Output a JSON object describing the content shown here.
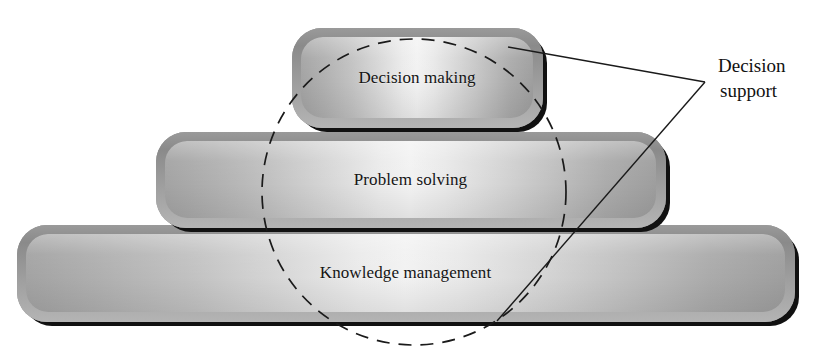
{
  "diagram": {
    "type": "layered-pyramid",
    "tiers": [
      {
        "id": "decision-making",
        "label": "Decision making",
        "level": 1
      },
      {
        "id": "problem-solving",
        "label": "Problem solving",
        "level": 2
      },
      {
        "id": "knowledge-management",
        "label": "Knowledge management",
        "level": 3
      }
    ],
    "callout": {
      "line1": "Decision",
      "line2": "support",
      "full_text": "Decision support"
    },
    "overlay": {
      "circle_label": "dashed-scope-circle",
      "circle": {
        "cx": 414,
        "cy": 192,
        "rx": 152,
        "ry": 153
      },
      "leaders": [
        {
          "id": "leader-upper",
          "from": [
            705,
            82
          ],
          "to": [
            508,
            47
          ]
        },
        {
          "id": "leader-lower",
          "from": [
            705,
            82
          ],
          "to": [
            497,
            321
          ]
        }
      ]
    },
    "colors": {
      "frame": "#8f8f8f",
      "panel_edge": "#a0a0a0",
      "panel_center": "#f2f2f2",
      "shadow": "#111111",
      "stroke": "#1a1a1a",
      "text": "#141414",
      "background": "#ffffff"
    }
  }
}
